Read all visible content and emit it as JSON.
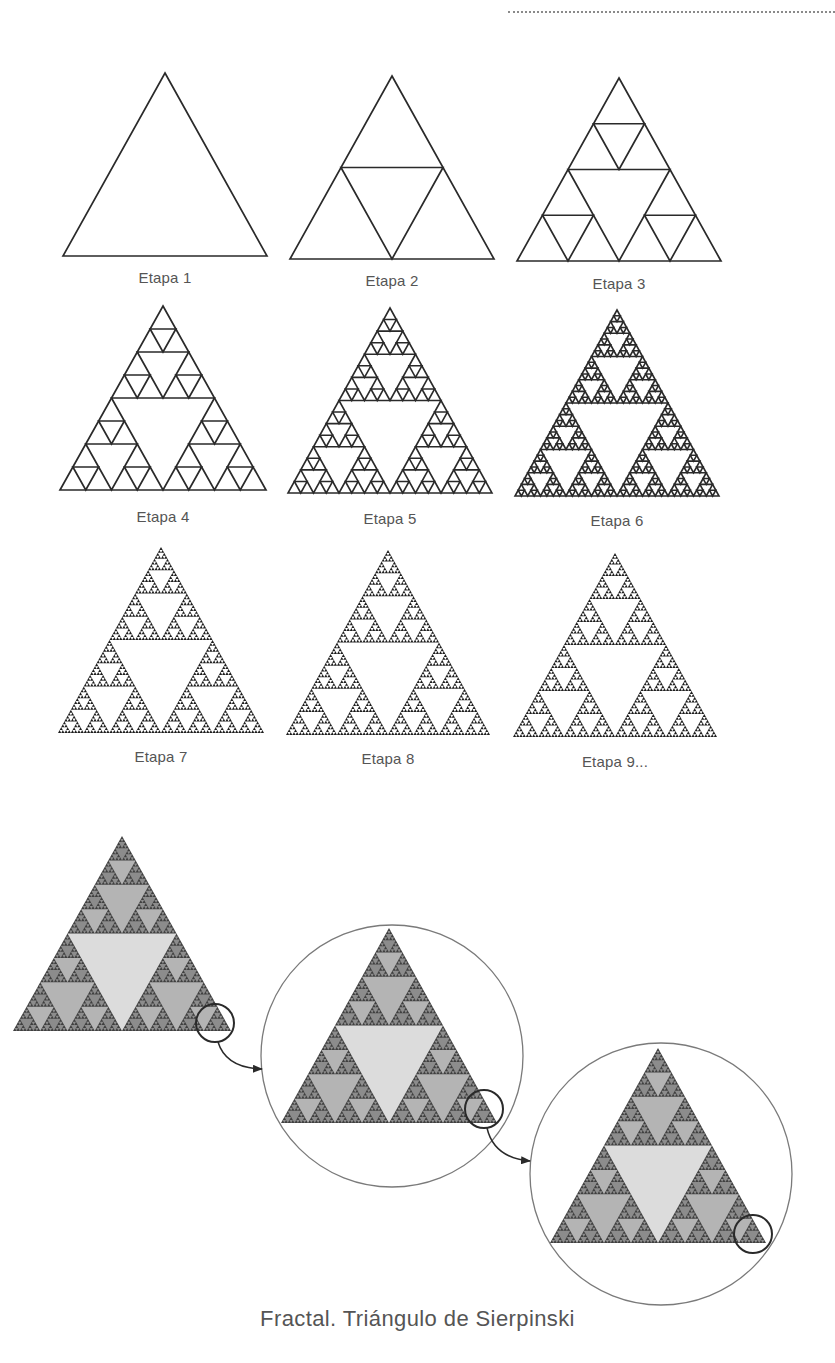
{
  "header": {
    "dotted_rule": true
  },
  "colors": {
    "outline": "#2a2a2a",
    "label_text": "#555555",
    "fractal_dark": "#404040",
    "fractal_hole_large": "#dcdcdc",
    "fractal_hole_mid": "#b4b4b4",
    "fractal_hole_small": "#8c8c8c",
    "circle_thin": "#7a7a7a",
    "circle_thick": "#2a2a2a",
    "arrow": "#2a2a2a"
  },
  "stages": [
    {
      "label": "Etapa 1",
      "depth": 0,
      "apex": [
        165,
        73
      ],
      "base_y": 256,
      "half_width": 102,
      "label_y": 269,
      "style": "outline"
    },
    {
      "label": "Etapa 2",
      "depth": 1,
      "apex": [
        392,
        76
      ],
      "base_y": 259,
      "half_width": 102,
      "label_y": 272,
      "style": "outline"
    },
    {
      "label": "Etapa 3",
      "depth": 2,
      "apex": [
        619,
        78
      ],
      "base_y": 261,
      "half_width": 102,
      "label_y": 275,
      "style": "outline"
    },
    {
      "label": "Etapa 4",
      "depth": 3,
      "apex": [
        163,
        306
      ],
      "base_y": 490,
      "half_width": 103,
      "label_y": 508,
      "style": "outline"
    },
    {
      "label": "Etapa 5",
      "depth": 4,
      "apex": [
        390,
        308
      ],
      "base_y": 493,
      "half_width": 102,
      "label_y": 510,
      "style": "outline"
    },
    {
      "label": "Etapa 6",
      "depth": 5,
      "apex": [
        617,
        310
      ],
      "base_y": 496,
      "half_width": 102,
      "label_y": 512,
      "style": "outline"
    },
    {
      "label": "Etapa 7",
      "depth": 6,
      "apex": [
        161,
        547
      ],
      "base_y": 733,
      "half_width": 103,
      "label_y": 748,
      "style": "solid"
    },
    {
      "label": "Etapa 8",
      "depth": 6,
      "apex": [
        388,
        550
      ],
      "base_y": 735,
      "half_width": 102,
      "label_y": 750,
      "style": "solid"
    },
    {
      "label": "Etapa 9...",
      "depth": 6,
      "apex": [
        615,
        553
      ],
      "base_y": 737,
      "half_width": 102,
      "label_y": 753,
      "style": "solid"
    }
  ],
  "zoom_sequence": {
    "triangles": [
      {
        "apex": [
          122,
          836
        ],
        "base_y": 1031,
        "half_width": 109,
        "depth": 6
      },
      {
        "apex": [
          389,
          928
        ],
        "base_y": 1123,
        "half_width": 108,
        "depth": 6
      },
      {
        "apex": [
          658,
          1048
        ],
        "base_y": 1243,
        "half_width": 108,
        "depth": 6
      }
    ],
    "big_circles": [
      {
        "cx": 392,
        "cy": 1056,
        "r": 131
      },
      {
        "cx": 661,
        "cy": 1174,
        "r": 131
      }
    ],
    "small_circles": [
      {
        "cx": 215,
        "cy": 1023,
        "r": 19
      },
      {
        "cx": 484,
        "cy": 1109,
        "r": 19
      },
      {
        "cx": 753,
        "cy": 1234,
        "r": 19
      }
    ],
    "arrows": [
      {
        "from": [
          218,
          1042
        ],
        "ctrl": [
          226,
          1068
        ],
        "to": [
          262,
          1069
        ]
      },
      {
        "from": [
          487,
          1128
        ],
        "ctrl": [
          494,
          1158
        ],
        "to": [
          530,
          1161
        ]
      }
    ]
  },
  "caption": "Fractal. Triángulo de Sierpinski"
}
